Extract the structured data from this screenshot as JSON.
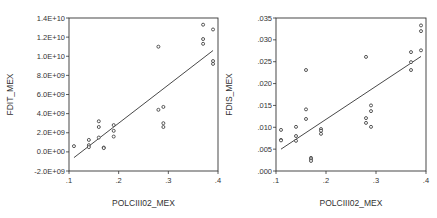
{
  "chart_data": [
    {
      "type": "scatter",
      "title": "",
      "xlabel": "POLCIII02_MEX",
      "ylabel": "FDIT_MEX",
      "xlim": [
        0.1,
        0.4
      ],
      "ylim": [
        -2000000000.0,
        14000000000.0
      ],
      "grid": false,
      "legend": null,
      "x_ticks": [
        ".1",
        ".2",
        ".3",
        ".4"
      ],
      "y_ticks": [
        "-2.0E+09",
        "0.0E+00",
        "2.0E+09",
        "4.0E+09",
        "6.0E+09",
        "8.0E+09",
        "1.0E+10",
        "1.2E+10",
        "1.4E+10"
      ],
      "y_tick_values": [
        -2000000000.0,
        0,
        2000000000.0,
        4000000000.0,
        6000000000.0,
        8000000000.0,
        10000000000.0,
        12000000000.0,
        14000000000.0
      ],
      "x_tick_values": [
        0.1,
        0.2,
        0.3,
        0.4
      ],
      "points": [
        [
          0.11,
          600000000.0
        ],
        [
          0.14,
          1250000000.0
        ],
        [
          0.14,
          700000000.0
        ],
        [
          0.14,
          500000000.0
        ],
        [
          0.16,
          3200000000.0
        ],
        [
          0.16,
          2600000000.0
        ],
        [
          0.16,
          1500000000.0
        ],
        [
          0.17,
          450000000.0
        ],
        [
          0.17,
          400000000.0
        ],
        [
          0.19,
          2800000000.0
        ],
        [
          0.19,
          2200000000.0
        ],
        [
          0.19,
          1600000000.0
        ],
        [
          0.28,
          11000000000.0
        ],
        [
          0.28,
          4400000000.0
        ],
        [
          0.29,
          4700000000.0
        ],
        [
          0.29,
          3000000000.0
        ],
        [
          0.29,
          2600000000.0
        ],
        [
          0.37,
          13300000000.0
        ],
        [
          0.37,
          11800000000.0
        ],
        [
          0.37,
          11300000000.0
        ],
        [
          0.39,
          12800000000.0
        ],
        [
          0.39,
          9500000000.0
        ],
        [
          0.39,
          9200000000.0
        ]
      ],
      "fit_line": [
        [
          0.11,
          -600000000.0
        ],
        [
          0.39,
          10600000000.0
        ]
      ]
    },
    {
      "type": "scatter",
      "title": "",
      "xlabel": "POLCIII02_MEX",
      "ylabel": "FDIS_MEX",
      "xlim": [
        0.1,
        0.4
      ],
      "ylim": [
        0.0,
        0.035
      ],
      "grid": false,
      "legend": null,
      "x_ticks": [
        ".1",
        ".2",
        ".3",
        ".4"
      ],
      "y_ticks": [
        ".000",
        ".005",
        ".010",
        ".015",
        ".020",
        ".025",
        ".030",
        ".035"
      ],
      "y_tick_values": [
        0.0,
        0.005,
        0.01,
        0.015,
        0.02,
        0.025,
        0.03,
        0.035
      ],
      "x_tick_values": [
        0.1,
        0.2,
        0.3,
        0.4
      ],
      "points": [
        [
          0.11,
          0.0094
        ],
        [
          0.11,
          0.0071
        ],
        [
          0.11,
          0.007
        ],
        [
          0.14,
          0.0101
        ],
        [
          0.14,
          0.008
        ],
        [
          0.14,
          0.0069
        ],
        [
          0.16,
          0.0231
        ],
        [
          0.16,
          0.0141
        ],
        [
          0.16,
          0.0119
        ],
        [
          0.17,
          0.003
        ],
        [
          0.17,
          0.0027
        ],
        [
          0.17,
          0.0023
        ],
        [
          0.19,
          0.0096
        ],
        [
          0.19,
          0.0092
        ],
        [
          0.19,
          0.0085
        ],
        [
          0.28,
          0.0261
        ],
        [
          0.28,
          0.0121
        ],
        [
          0.28,
          0.011
        ],
        [
          0.29,
          0.015
        ],
        [
          0.29,
          0.0137
        ],
        [
          0.29,
          0.0101
        ],
        [
          0.37,
          0.0272
        ],
        [
          0.37,
          0.0249
        ],
        [
          0.37,
          0.0231
        ],
        [
          0.39,
          0.0333
        ],
        [
          0.39,
          0.032
        ],
        [
          0.39,
          0.0276
        ]
      ],
      "fit_line": [
        [
          0.11,
          0.005
        ],
        [
          0.39,
          0.0262
        ]
      ]
    }
  ],
  "style": {
    "point_color": "#444444",
    "line_color": "#333333",
    "axis_color": "#333333"
  }
}
